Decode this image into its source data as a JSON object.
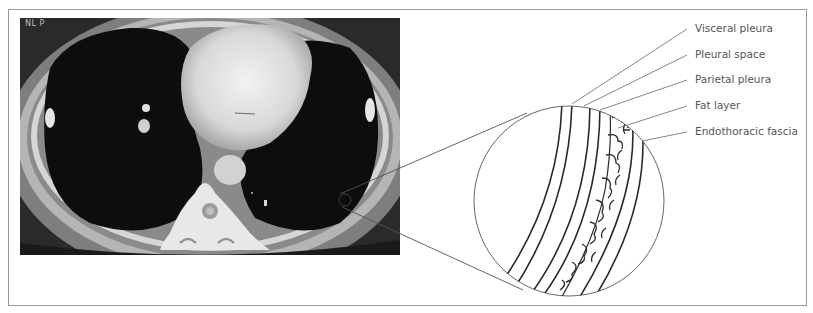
{
  "figure": {
    "ct_image": {
      "description": "Axial chest CT scan at heart level",
      "corner_tag": "NL P"
    },
    "magnified_view": {
      "description": "Magnified schematic of chest wall layers"
    },
    "labels": [
      {
        "text": "Visceral pleura"
      },
      {
        "text": "Pleural space"
      },
      {
        "text": "Parietal pleura"
      },
      {
        "text": "Fat layer"
      },
      {
        "text": "Endothoracic fascia"
      }
    ],
    "colors": {
      "frame": "#9a9a9a",
      "leader_lines": "#777777",
      "label_text": "#555555",
      "layer_lines": "#2a2a2a"
    }
  }
}
